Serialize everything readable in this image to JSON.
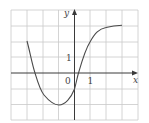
{
  "graph": {
    "x_axis_label": "x",
    "y_axis_label": "y",
    "origin_label": "0",
    "x_tick_label": "1",
    "y_tick_label": "1",
    "grid": {
      "x_min": -4,
      "x_max": 4,
      "y_min": -3,
      "y_max": 4
    },
    "curve_points": [
      [
        -3,
        2
      ],
      [
        -2.5,
        0
      ],
      [
        -2,
        -1.3
      ],
      [
        -1,
        -2
      ],
      [
        0,
        -1
      ],
      [
        0.25,
        0
      ],
      [
        1,
        2
      ],
      [
        2,
        2.85
      ],
      [
        3,
        3
      ]
    ],
    "colors": {
      "grid": "#c9c9c9",
      "axis": "#3a3a3a",
      "curve": "#4a4a4a"
    }
  }
}
